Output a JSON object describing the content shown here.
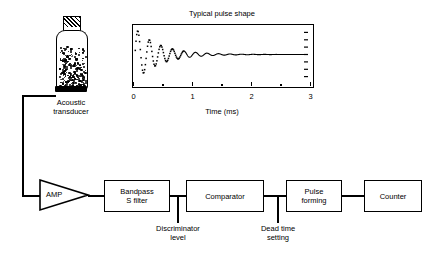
{
  "figure": {
    "transducer": {
      "label_line1": "Acoustic",
      "label_line2": "transducer"
    },
    "annotations": [
      {
        "name": "discriminator-level",
        "line1": "Discriminator",
        "line2": "level"
      },
      {
        "name": "dead-time-setting",
        "line1": "Dead time",
        "line2": "setting"
      }
    ],
    "blocks": [
      {
        "name": "amp",
        "label": "AMP",
        "shape": "triangle"
      },
      {
        "name": "bandpass-filter",
        "line1": "Bandpass",
        "line2": "S filter",
        "shape": "rect"
      },
      {
        "name": "comparator",
        "line1": "Comparator",
        "line2": "",
        "shape": "rect"
      },
      {
        "name": "pulse-forming",
        "line1": "Pulse",
        "line2": "forming",
        "shape": "rect"
      },
      {
        "name": "counter",
        "line1": "Counter",
        "line2": "",
        "shape": "rect"
      }
    ]
  },
  "chart_data": {
    "type": "line",
    "title": "Typical pulse shape",
    "xlabel": "Time (ms)",
    "ylabel": "",
    "xlim": [
      0,
      3
    ],
    "ylim": [
      -1.05,
      1.05
    ],
    "grid": false,
    "legend": false,
    "major_ticks": [
      0,
      1,
      2,
      3
    ],
    "minor_ticks": [
      0.5,
      1.5,
      2.5
    ],
    "tick_labels": [
      "0",
      "1",
      "2",
      "3"
    ],
    "right_axis_ticks": 8,
    "series": [
      {
        "name": "pulse",
        "render": "damped-sine",
        "amplitude": 1.0,
        "frequency_khz": 5.0,
        "decay_constant_ms": 0.42,
        "dot_region_end_ms": 0.85,
        "baseline": 0.0
      }
    ]
  }
}
